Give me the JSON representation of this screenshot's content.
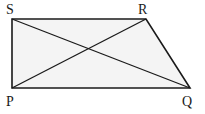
{
  "figure": {
    "shape": "trapezium",
    "vertices": {
      "S": {
        "label": "S",
        "x": 12,
        "y": 19
      },
      "R": {
        "label": "R",
        "x": 146,
        "y": 19
      },
      "Q": {
        "label": "Q",
        "x": 190,
        "y": 88
      },
      "P": {
        "label": "P",
        "x": 12,
        "y": 88
      }
    },
    "edges": [
      "SR",
      "RQ",
      "QP",
      "PS"
    ],
    "diagonals": [
      "SQ",
      "PR"
    ],
    "stroke_color": "#1a1a1a",
    "fill_color": "#f4f4f4"
  }
}
